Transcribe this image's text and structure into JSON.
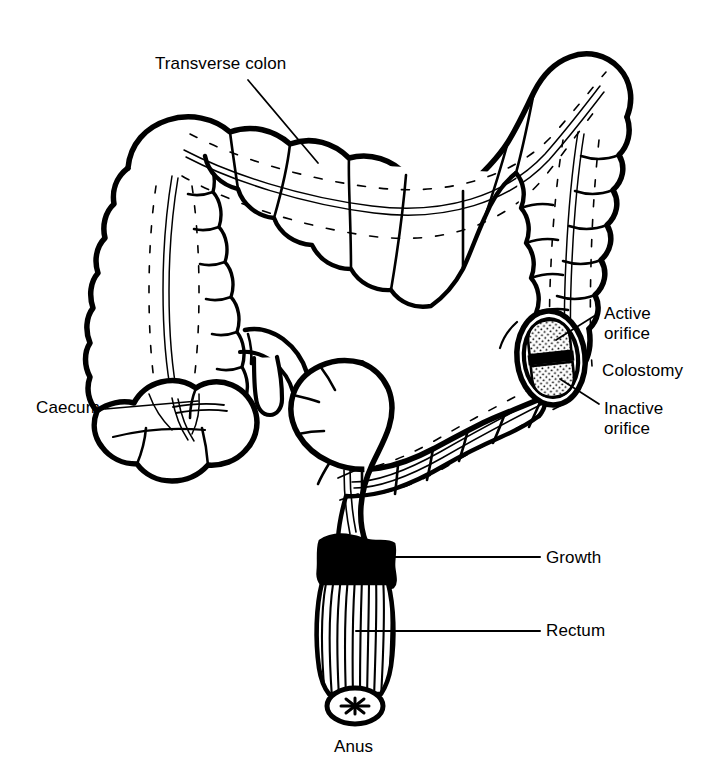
{
  "figure": {
    "background_color": "#ffffff",
    "ink_color": "#000000",
    "width": 710,
    "height": 770
  },
  "labels": {
    "transverse_colon": "Transverse colon",
    "caecum": "Caecum",
    "active_orifice": "Active\norifice",
    "colostomy": "Colostomy",
    "inactive_orifice": "Inactive\norifice",
    "growth": "Growth",
    "rectum": "Rectum",
    "anus": "Anus"
  },
  "diagram_parts": [
    {
      "name": "transverse-colon",
      "label": "Transverse colon"
    },
    {
      "name": "ascending-colon",
      "label": ""
    },
    {
      "name": "caecum",
      "label": "Caecum"
    },
    {
      "name": "appendix",
      "label": ""
    },
    {
      "name": "ileum",
      "label": ""
    },
    {
      "name": "descending-colon",
      "label": ""
    },
    {
      "name": "colostomy-stoma",
      "label": "Colostomy"
    },
    {
      "name": "active-orifice",
      "label": "Active orifice"
    },
    {
      "name": "inactive-orifice",
      "label": "Inactive orifice"
    },
    {
      "name": "sigmoid-colon",
      "label": ""
    },
    {
      "name": "growth",
      "label": "Growth"
    },
    {
      "name": "rectum",
      "label": "Rectum"
    },
    {
      "name": "anus",
      "label": "Anus"
    }
  ]
}
